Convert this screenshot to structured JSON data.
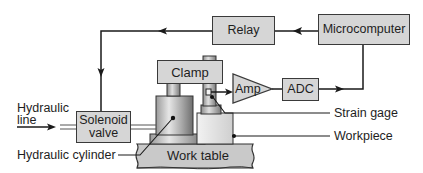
{
  "diagram": {
    "blocks": {
      "relay": "Relay",
      "microcomputer": "Microcomputer",
      "clamp": "Clamp",
      "amp": "Amp",
      "adc": "ADC",
      "solenoid_line1": "Solenoid",
      "solenoid_line2": "valve",
      "work_table": "Work table"
    },
    "labels": {
      "hydraulic_line1": "Hydraulic",
      "hydraulic_line2": "line",
      "strain_gage": "Strain gage",
      "workpiece": "Workpiece",
      "hydraulic_cylinder": "Hydraulic cylinder"
    },
    "colors": {
      "block_fill": "#d6d6d6",
      "line": "#1a1a1a",
      "background": "#ffffff"
    },
    "connections": [
      {
        "from": "Microcomputer",
        "to": "Relay"
      },
      {
        "from": "Relay",
        "to": "Solenoid valve"
      },
      {
        "from": "Hydraulic line",
        "to": "Solenoid valve"
      },
      {
        "from": "Solenoid valve",
        "to": "Hydraulic cylinder"
      },
      {
        "from": "Strain gage",
        "to": "Amp"
      },
      {
        "from": "Amp",
        "to": "ADC"
      },
      {
        "from": "ADC",
        "to": "Microcomputer"
      }
    ]
  }
}
